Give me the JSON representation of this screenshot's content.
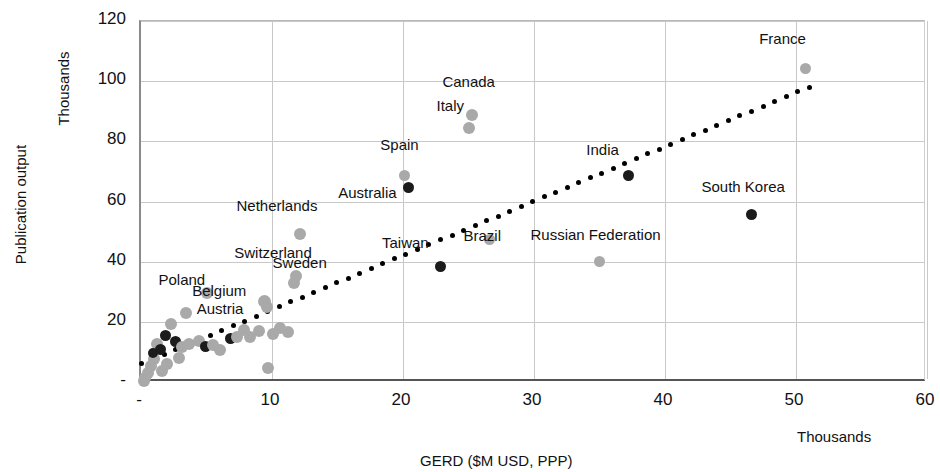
{
  "chart_data": {
    "type": "scatter",
    "title": "",
    "xlabel": "GERD ($M USD, PPP)",
    "ylabel": "Publication output",
    "x_unit_label": "Thousands",
    "y_unit_label": "Thousands",
    "xlim": [
      0,
      60
    ],
    "ylim": [
      0,
      120
    ],
    "xticks": [
      "-",
      "10",
      "20",
      "30",
      "40",
      "50",
      "60"
    ],
    "xtick_values": [
      0,
      10,
      20,
      30,
      40,
      50,
      60
    ],
    "yticks": [
      "-",
      "20",
      "40",
      "60",
      "80",
      "100",
      "120"
    ],
    "ytick_values": [
      0,
      20,
      40,
      60,
      80,
      100,
      120
    ],
    "grid": true,
    "legend": "none",
    "series": [
      {
        "name": "labelled countries",
        "marker": "circle",
        "color": "#a9a9a9",
        "points": [
          {
            "label": "France",
            "x": 50.7,
            "y": 104.3,
            "color": "#a9a9a9",
            "size": 11
          },
          {
            "label": "Canada",
            "x": 25.3,
            "y": 88.7,
            "color": "#a9a9a9",
            "size": 12
          },
          {
            "label": "Italy",
            "x": 25.0,
            "y": 84.3,
            "color": "#a9a9a9",
            "size": 12
          },
          {
            "label": "Spain",
            "x": 20.1,
            "y": 68.7,
            "color": "#a9a9a9",
            "size": 11
          },
          {
            "label": "Australia",
            "x": 20.4,
            "y": 64.8,
            "color": "#1b1b1b",
            "size": 11
          },
          {
            "label": "India",
            "x": 37.2,
            "y": 68.5,
            "color": "#1b1b1b",
            "size": 11
          },
          {
            "label": "South Korea",
            "x": 46.6,
            "y": 55.8,
            "color": "#1b1b1b",
            "size": 11
          },
          {
            "label": "Brazil",
            "x": 26.6,
            "y": 47.5,
            "color": "#a9a9a9",
            "size": 11
          },
          {
            "label": "Russian Federation",
            "x": 35.0,
            "y": 39.9,
            "color": "#a9a9a9",
            "size": 11
          },
          {
            "label": "Taiwan",
            "x": 22.9,
            "y": 38.5,
            "color": "#1b1b1b",
            "size": 11
          },
          {
            "label": "Netherlands",
            "x": 12.1,
            "y": 49.2,
            "color": "#a9a9a9",
            "size": 12
          },
          {
            "label": "Switzerland",
            "x": 11.7,
            "y": 32.9,
            "color": "#a9a9a9",
            "size": 12
          },
          {
            "label": "Sweden",
            "x": 11.8,
            "y": 35.2,
            "color": "#a9a9a9",
            "size": 12
          },
          {
            "label": "Belgium",
            "x": 9.4,
            "y": 26.9,
            "color": "#a9a9a9",
            "size": 13
          },
          {
            "label": "Poland",
            "x": 5.0,
            "y": 29.6,
            "color": "#a9a9a9",
            "size": 12
          },
          {
            "label": "Austria",
            "x": 9.6,
            "y": 24.8,
            "color": "#a9a9a9",
            "size": 12
          }
        ]
      },
      {
        "name": "unlabelled countries",
        "marker": "circle",
        "points": [
          {
            "x": 9.7,
            "y": 4.6,
            "color": "#a9a9a9",
            "size": 12
          },
          {
            "x": 3.4,
            "y": 23.0,
            "color": "#a9a9a9",
            "size": 12
          },
          {
            "x": 2.3,
            "y": 19.3,
            "color": "#a9a9a9",
            "size": 12
          },
          {
            "x": 1.9,
            "y": 15.6,
            "color": "#1b1b1b",
            "size": 11
          },
          {
            "x": 2.6,
            "y": 13.3,
            "color": "#1b1b1b",
            "size": 11
          },
          {
            "x": 1.2,
            "y": 12.6,
            "color": "#a9a9a9",
            "size": 12
          },
          {
            "x": 1.5,
            "y": 10.9,
            "color": "#1b1b1b",
            "size": 11
          },
          {
            "x": 3.1,
            "y": 11.7,
            "color": "#a9a9a9",
            "size": 12
          },
          {
            "x": 3.7,
            "y": 12.6,
            "color": "#a9a9a9",
            "size": 12
          },
          {
            "x": 4.4,
            "y": 13.6,
            "color": "#a9a9a9",
            "size": 12
          },
          {
            "x": 4.9,
            "y": 11.7,
            "color": "#1b1b1b",
            "size": 11
          },
          {
            "x": 5.5,
            "y": 12.2,
            "color": "#a9a9a9",
            "size": 12
          },
          {
            "x": 6.0,
            "y": 10.7,
            "color": "#a9a9a9",
            "size": 12
          },
          {
            "x": 6.8,
            "y": 14.3,
            "color": "#1b1b1b",
            "size": 11
          },
          {
            "x": 7.3,
            "y": 15.0,
            "color": "#a9a9a9",
            "size": 12
          },
          {
            "x": 7.9,
            "y": 17.3,
            "color": "#a9a9a9",
            "size": 12
          },
          {
            "x": 8.3,
            "y": 15.0,
            "color": "#a9a9a9",
            "size": 12
          },
          {
            "x": 9.0,
            "y": 17.0,
            "color": "#a9a9a9",
            "size": 12
          },
          {
            "x": 10.1,
            "y": 16.0,
            "color": "#a9a9a9",
            "size": 12
          },
          {
            "x": 10.6,
            "y": 18.0,
            "color": "#a9a9a9",
            "size": 12
          },
          {
            "x": 11.2,
            "y": 16.5,
            "color": "#a9a9a9",
            "size": 12
          },
          {
            "x": 1.0,
            "y": 7.5,
            "color": "#a9a9a9",
            "size": 12
          },
          {
            "x": 0.8,
            "y": 5.3,
            "color": "#a9a9a9",
            "size": 12
          },
          {
            "x": 0.5,
            "y": 3.0,
            "color": "#a9a9a9",
            "size": 12
          },
          {
            "x": 0.3,
            "y": 1.2,
            "color": "#a9a9a9",
            "size": 12
          },
          {
            "x": 1.6,
            "y": 3.5,
            "color": "#a9a9a9",
            "size": 12
          },
          {
            "x": 2.0,
            "y": 6.0,
            "color": "#a9a9a9",
            "size": 12
          },
          {
            "x": 2.9,
            "y": 8.0,
            "color": "#a9a9a9",
            "size": 12
          },
          {
            "x": 0.9,
            "y": 9.6,
            "color": "#1b1b1b",
            "size": 10
          },
          {
            "x": 0.2,
            "y": 0.4,
            "color": "#a9a9a9",
            "size": 12
          }
        ]
      }
    ],
    "trendline": {
      "style": "dotted",
      "color": "#000000",
      "x_start": 0.0,
      "y_start": 6.0,
      "x_end": 51.0,
      "y_end": 98.0
    }
  },
  "labels": {
    "y_axis_title": "Publication output",
    "y_unit": "Thousands",
    "x_axis_title": "GERD ($M USD, PPP)",
    "x_unit": "Thousands"
  }
}
